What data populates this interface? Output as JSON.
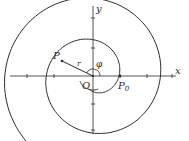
{
  "diagram": {
    "colors": {
      "stroke": "#2a2a2a",
      "background": "#ffffff"
    },
    "origin": {
      "x": 93,
      "y": 76
    },
    "axes": {
      "x": {
        "label": "x",
        "from": 10,
        "to": 176
      },
      "y": {
        "label": "y",
        "from": 6,
        "to": 134
      },
      "ticks_x": [
        27,
        54,
        120,
        147,
        172
      ],
      "ticks_y": [
        18,
        48,
        104,
        130
      ]
    },
    "spiral": {
      "r0": 26,
      "growth_per_radian": 6.6,
      "phi_start": -1.9,
      "phi_end": 10.75,
      "inner_hook": {
        "phi_start": -2.75,
        "phi_end": -1.2,
        "r": 14
      }
    },
    "labels": {
      "y_axis": "y",
      "x_axis": "x",
      "origin": "O",
      "point": "P",
      "start_point": "P",
      "start_point_sub": "0",
      "radius": "r",
      "angle": "φ"
    },
    "point_P": {
      "x": 62,
      "y": 61
    },
    "point_P0": {
      "x": 120,
      "y": 76
    }
  }
}
